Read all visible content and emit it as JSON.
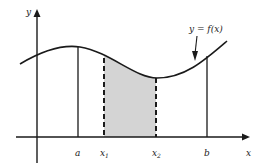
{
  "diagram": {
    "axis_labels": {
      "y": "y",
      "x": "x"
    },
    "curve_label": "y = f(x)",
    "x_markers": [
      {
        "id": "a",
        "label": "a",
        "style": "solid"
      },
      {
        "id": "x1",
        "label": "x",
        "subscript": "1",
        "style": "dashed"
      },
      {
        "id": "x2",
        "label": "x",
        "subscript": "2",
        "style": "dashed"
      },
      {
        "id": "b",
        "label": "b",
        "style": "solid"
      }
    ],
    "shaded_region": "area under curve between x1 and x2",
    "colors": {
      "line": "#1a1a1a",
      "shade": "#d4d4d4",
      "background": "#ffffff"
    }
  }
}
